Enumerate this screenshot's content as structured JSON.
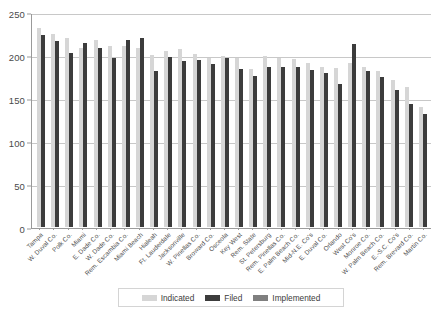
{
  "chart_data": {
    "type": "bar",
    "title": "",
    "subtitle": "",
    "xlabel": "",
    "ylabel": "",
    "ylim": [
      0,
      250
    ],
    "yticks": [
      0,
      50,
      100,
      150,
      200,
      250
    ],
    "grid": true,
    "legend_position": "bottom-center",
    "orientation": "vertical",
    "grouping": "grouped",
    "categories": [
      "Tampa",
      "W. Duval Co.",
      "Polk Co.",
      "Miami",
      "E. Dade Co.",
      "W. Dade Co.",
      "Rem. Escambia Co.",
      "Miami Beach",
      "Hialeah",
      "Ft. Lauderdale",
      "Jacksonville",
      "W. Pinellas Co.",
      "Broward Co.",
      "Osceola",
      "Key West",
      "Rem. State",
      "St. Petersburg",
      "Rem. Pinellas Co.",
      "E. Palm Beach Co.",
      "Mid-N.E. Co's",
      "E. Duval Co.",
      "Orlando",
      "West Co's",
      "Monroe Co.",
      "W. Palm Beach Co.",
      "E.-S.C. Co's",
      "Rem. Brevard Co.",
      "Martin Co."
    ],
    "series": [
      {
        "name": "Indicated",
        "color": "#d6d6d6",
        "values": [
          231,
          224,
          220,
          208,
          217,
          211,
          210,
          208,
          200,
          205,
          207,
          201,
          197,
          199,
          196,
          184,
          199,
          196,
          195,
          191,
          186,
          185,
          191,
          186,
          181,
          171,
          163,
          140
        ]
      },
      {
        "name": "Filed",
        "color": "#3c3c3c",
        "values": [
          223,
          216,
          202,
          214,
          208,
          196,
          218,
          220,
          181,
          198,
          193,
          194,
          189,
          196,
          184,
          176,
          186,
          186,
          186,
          183,
          179,
          166,
          213,
          181,
          174,
          159,
          143,
          131
        ]
      },
      {
        "name": "Implemented",
        "color": "#7f7f7f",
        "values": [
          223,
          216,
          202,
          214,
          208,
          196,
          218,
          220,
          181,
          198,
          193,
          194,
          189,
          196,
          184,
          176,
          186,
          186,
          186,
          183,
          179,
          166,
          213,
          181,
          174,
          159,
          143,
          131
        ]
      }
    ]
  },
  "legend": {
    "entries": [
      {
        "label": "Indicated",
        "color": "#d6d6d6"
      },
      {
        "label": "Filed",
        "color": "#3c3c3c"
      },
      {
        "label": "Implemented",
        "color": "#7f7f7f"
      }
    ]
  },
  "caption": {
    "text": ""
  }
}
